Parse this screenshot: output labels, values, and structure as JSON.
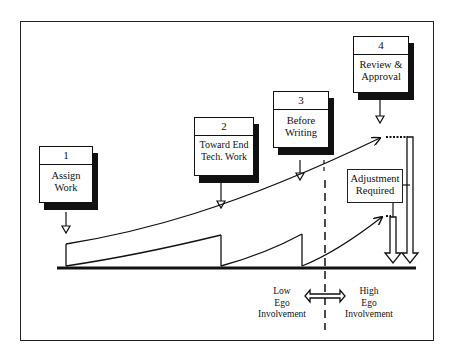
{
  "diagram": {
    "stages": [
      {
        "number": "1",
        "label_line1": "Assign",
        "label_line2": "Work"
      },
      {
        "number": "2",
        "label_line1": "Toward End",
        "label_line2": "Tech. Work"
      },
      {
        "number": "3",
        "label_line1": "Before",
        "label_line2": "Writing"
      },
      {
        "number": "4",
        "label_line1": "Review &",
        "label_line2": "Approval"
      }
    ],
    "adjustment": {
      "line1": "Adjustment",
      "line2": "Required"
    },
    "ego": {
      "low": {
        "line1": "Low",
        "line2": "Ego",
        "line3": "Involvement"
      },
      "high": {
        "line1": "High",
        "line2": "Ego",
        "line3": "Involvement"
      }
    },
    "colors": {
      "ink": "#111111",
      "background": "#ffffff"
    }
  }
}
